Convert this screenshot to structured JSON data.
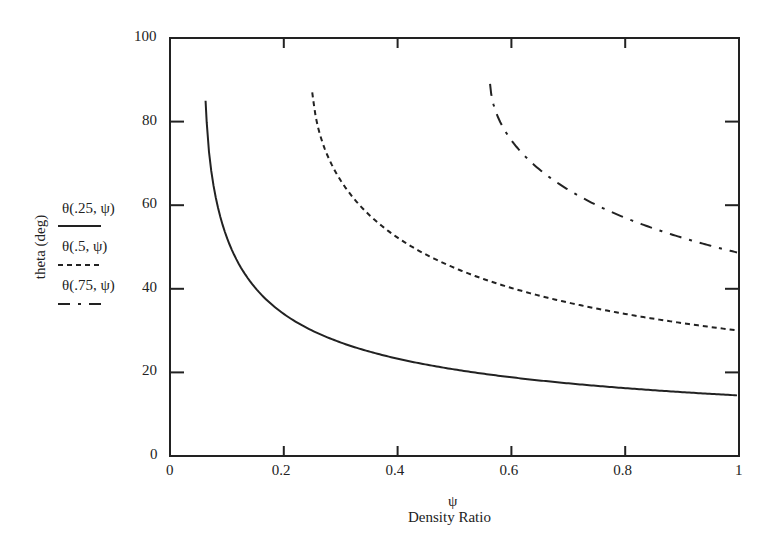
{
  "chart_data": {
    "type": "line",
    "title": "",
    "xlabel_symbol": "ψ",
    "xlabel": "Density Ratio",
    "ylabel": "theta (deg)",
    "xlim": [
      0,
      1
    ],
    "ylim": [
      0,
      100
    ],
    "x_ticks": [
      "0",
      "0.2",
      "0.4",
      "0.6",
      "0.8",
      "1"
    ],
    "y_ticks": [
      "0",
      "20",
      "40",
      "60",
      "80",
      "100"
    ],
    "grid": false,
    "legend_position": "left, stacked beside y-axis label",
    "series": [
      {
        "name": "θ(.25, ψ)",
        "style": "solid",
        "x": [
          0.0625,
          0.07,
          0.08,
          0.1,
          0.12,
          0.15,
          0.2,
          0.25,
          0.3,
          0.4,
          0.5,
          0.6,
          0.7,
          0.8,
          0.9,
          1.0
        ],
        "y": [
          85,
          70.8,
          62.1,
          52.2,
          46.2,
          40.2,
          34.0,
          30.0,
          27.2,
          23.3,
          20.7,
          18.8,
          17.4,
          16.2,
          15.3,
          14.5
        ]
      },
      {
        "name": "θ(.5, ψ)",
        "style": "dashed",
        "x": [
          0.25,
          0.26,
          0.28,
          0.3,
          0.35,
          0.4,
          0.5,
          0.6,
          0.7,
          0.8,
          0.9,
          1.0
        ],
        "y": [
          87,
          78.7,
          70.9,
          65.9,
          57.7,
          52.2,
          45.0,
          40.2,
          36.7,
          34.0,
          31.8,
          30.0
        ]
      },
      {
        "name": "θ(.75, ψ)",
        "style": "dash-dot",
        "x": [
          0.5625,
          0.57,
          0.6,
          0.65,
          0.7,
          0.75,
          0.8,
          0.85,
          0.9,
          0.95,
          1.0
        ],
        "y": [
          89,
          83.4,
          75.5,
          68.5,
          63.7,
          60.0,
          57.0,
          54.4,
          52.2,
          50.3,
          48.6
        ]
      }
    ]
  },
  "legend": {
    "s1": "θ(.25, ψ)",
    "s2": "θ(.5, ψ)",
    "s3": "θ(.75, ψ)"
  }
}
